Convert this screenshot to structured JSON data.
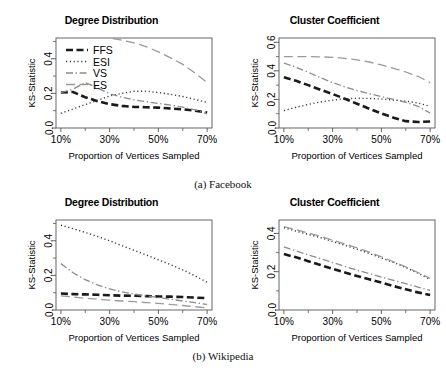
{
  "figure": {
    "captions": [
      {
        "id": "cap-a",
        "text": "(a) Facebook"
      },
      {
        "id": "cap-b",
        "text": "(b) Wikipedia"
      }
    ]
  },
  "axis": {
    "xlabel": "Proportion of Vertices Sampled",
    "ylabel": "KS-Statistic",
    "xticks": [
      "10%",
      "30%",
      "50%",
      "70%"
    ],
    "xtick_values": [
      10,
      30,
      50,
      70
    ],
    "yticks_small": [
      "0.0",
      "0.2",
      "0.4"
    ],
    "yticks_large": [
      "0.0",
      "0.2",
      "0.4",
      "0.6"
    ]
  },
  "legend": {
    "visible_on_panel": "facebook-degree-distribution",
    "entries": [
      {
        "label": "FFS",
        "dash": "dashed-thick",
        "color": "#1a1a1a",
        "width": 2.6
      },
      {
        "label": "ESI",
        "dash": "dotted",
        "color": "#3c3c3c",
        "width": 1.4
      },
      {
        "label": "VS",
        "dash": "dashdot",
        "color": "#8c8c8c",
        "width": 1.3
      },
      {
        "label": "ES",
        "dash": "longdash",
        "color": "#9a9a9a",
        "width": 1.3
      }
    ]
  },
  "chart_data": [
    {
      "id": "facebook-degree-distribution",
      "type": "line",
      "title": "Degree Distribution",
      "group": "(a) Facebook",
      "xlabel": "Proportion of Vertices Sampled",
      "ylabel": "KS-Statistic",
      "xlim": [
        8,
        72
      ],
      "ylim": [
        0.0,
        0.52
      ],
      "grid": false,
      "legend": "top-left",
      "x": [
        10,
        15,
        20,
        25,
        30,
        35,
        40,
        45,
        50,
        55,
        60,
        65,
        70
      ],
      "series": [
        {
          "name": "FFS",
          "values": [
            0.205,
            0.208,
            0.178,
            0.155,
            0.138,
            0.128,
            0.122,
            0.12,
            0.118,
            0.113,
            0.108,
            0.1,
            0.09
          ]
        },
        {
          "name": "ESI",
          "values": [
            0.085,
            0.11,
            0.135,
            0.16,
            0.185,
            0.2,
            0.212,
            0.213,
            0.205,
            0.195,
            0.182,
            0.165,
            0.148
          ]
        },
        {
          "name": "VS",
          "values": [
            0.205,
            0.225,
            0.262,
            0.232,
            0.198,
            0.178,
            0.162,
            0.152,
            0.142,
            0.132,
            0.12,
            0.105,
            0.082
          ]
        },
        {
          "name": "ES",
          "values": [
            0.6,
            0.59,
            0.57,
            0.545,
            0.52,
            0.508,
            0.492,
            0.47,
            0.44,
            0.405,
            0.368,
            0.318,
            0.262
          ]
        }
      ]
    },
    {
      "id": "facebook-cluster-coefficient",
      "type": "line",
      "title": "Cluster Coefficient",
      "group": "(a) Facebook",
      "xlabel": "Proportion of Vertices Sampled",
      "ylabel": "KS-Statistic",
      "xlim": [
        8,
        72
      ],
      "ylim": [
        0.0,
        0.63
      ],
      "grid": false,
      "legend": "none",
      "x": [
        10,
        15,
        20,
        25,
        30,
        35,
        40,
        45,
        50,
        55,
        60,
        65,
        70
      ],
      "series": [
        {
          "name": "FFS",
          "values": [
            0.355,
            0.33,
            0.3,
            0.268,
            0.238,
            0.205,
            0.17,
            0.135,
            0.102,
            0.072,
            0.048,
            0.042,
            0.045
          ]
        },
        {
          "name": "ESI",
          "values": [
            0.122,
            0.145,
            0.165,
            0.182,
            0.195,
            0.205,
            0.208,
            0.207,
            0.203,
            0.196,
            0.188,
            0.175,
            0.152
          ]
        },
        {
          "name": "VS",
          "values": [
            0.455,
            0.425,
            0.39,
            0.352,
            0.318,
            0.288,
            0.262,
            0.24,
            0.22,
            0.2,
            0.18,
            0.152,
            0.105
          ]
        },
        {
          "name": "ES",
          "values": [
            0.5,
            0.5,
            0.5,
            0.498,
            0.495,
            0.488,
            0.477,
            0.462,
            0.442,
            0.418,
            0.392,
            0.362,
            0.318
          ]
        }
      ]
    },
    {
      "id": "wikipedia-degree-distribution",
      "type": "line",
      "title": "Degree Distribution",
      "group": "(b) Wikipedia",
      "xlabel": "Proportion of Vertices Sampled",
      "ylabel": "KS-Statistic",
      "xlim": [
        8,
        72
      ],
      "ylim": [
        0.0,
        0.52
      ],
      "grid": false,
      "legend": "none",
      "x": [
        10,
        15,
        20,
        25,
        30,
        35,
        40,
        45,
        50,
        55,
        60,
        65,
        70
      ],
      "series": [
        {
          "name": "FFS",
          "values": [
            0.095,
            0.092,
            0.09,
            0.088,
            0.085,
            0.083,
            0.082,
            0.08,
            0.078,
            0.077,
            0.075,
            0.072,
            0.068
          ]
        },
        {
          "name": "ESI",
          "values": [
            0.49,
            0.47,
            0.448,
            0.425,
            0.4,
            0.372,
            0.345,
            0.318,
            0.29,
            0.262,
            0.232,
            0.198,
            0.16
          ]
        },
        {
          "name": "VS",
          "values": [
            0.268,
            0.215,
            0.175,
            0.145,
            0.122,
            0.105,
            0.092,
            0.082,
            0.072,
            0.062,
            0.052,
            0.042,
            0.032
          ]
        },
        {
          "name": "ES",
          "values": [
            0.082,
            0.075,
            0.068,
            0.062,
            0.057,
            0.052,
            0.048,
            0.043,
            0.038,
            0.032,
            0.026,
            0.019,
            0.012
          ]
        }
      ]
    },
    {
      "id": "wikipedia-cluster-coefficient",
      "type": "line",
      "title": "Cluster Coefficient",
      "group": "(b) Wikipedia",
      "xlabel": "Proportion of Vertices Sampled",
      "ylabel": "KS-Statistic",
      "xlim": [
        8,
        72
      ],
      "ylim": [
        0.0,
        0.47
      ],
      "grid": false,
      "legend": "none",
      "x": [
        10,
        15,
        20,
        25,
        30,
        35,
        40,
        45,
        50,
        55,
        60,
        65,
        70
      ],
      "series": [
        {
          "name": "FFS",
          "values": [
            0.292,
            0.275,
            0.255,
            0.235,
            0.215,
            0.196,
            0.178,
            0.16,
            0.143,
            0.125,
            0.108,
            0.092,
            0.078
          ]
        },
        {
          "name": "ESI",
          "values": [
            0.43,
            0.412,
            0.395,
            0.378,
            0.358,
            0.338,
            0.318,
            0.295,
            0.272,
            0.248,
            0.222,
            0.192,
            0.16
          ]
        },
        {
          "name": "VS",
          "values": [
            0.33,
            0.308,
            0.288,
            0.268,
            0.248,
            0.228,
            0.208,
            0.19,
            0.172,
            0.155,
            0.138,
            0.12,
            0.102
          ]
        },
        {
          "name": "ES",
          "values": [
            0.435,
            0.42,
            0.402,
            0.385,
            0.365,
            0.345,
            0.325,
            0.302,
            0.278,
            0.252,
            0.225,
            0.196,
            0.165
          ]
        }
      ]
    }
  ]
}
